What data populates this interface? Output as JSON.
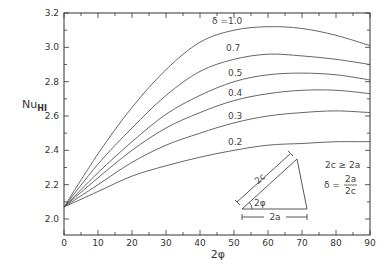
{
  "chart_data": {
    "type": "line",
    "title": "",
    "xlabel": "2φ",
    "ylabel": "Nu_HI",
    "xlim": [
      0,
      90
    ],
    "ylim": [
      2.0,
      3.2
    ],
    "grid": false,
    "x_ticks": [
      0,
      10,
      20,
      30,
      40,
      50,
      60,
      70,
      80,
      90
    ],
    "y_ticks": [
      2.0,
      2.2,
      2.4,
      2.6,
      2.8,
      3.0,
      3.2
    ],
    "x": [
      0,
      10,
      20,
      30,
      40,
      50,
      60,
      70,
      80,
      90
    ],
    "series": [
      {
        "name": "δ = 1.0",
        "label": "δ =1.0",
        "values": [
          2.07,
          2.38,
          2.65,
          2.87,
          3.03,
          3.1,
          3.12,
          3.11,
          3.07,
          3.01
        ]
      },
      {
        "name": "δ = 0.7",
        "label": "0.7",
        "values": [
          2.07,
          2.32,
          2.53,
          2.72,
          2.86,
          2.93,
          2.96,
          2.95,
          2.93,
          2.9
        ]
      },
      {
        "name": "δ = 0.5",
        "label": "0.5",
        "values": [
          2.07,
          2.27,
          2.45,
          2.61,
          2.72,
          2.8,
          2.84,
          2.85,
          2.84,
          2.81
        ]
      },
      {
        "name": "δ = 0.4",
        "label": "0.4",
        "values": [
          2.07,
          2.24,
          2.4,
          2.53,
          2.62,
          2.69,
          2.73,
          2.75,
          2.75,
          2.73
        ]
      },
      {
        "name": "δ = 0.3",
        "label": "0.3",
        "values": [
          2.07,
          2.2,
          2.33,
          2.43,
          2.5,
          2.56,
          2.6,
          2.62,
          2.63,
          2.62
        ]
      },
      {
        "name": "δ = 0.2",
        "label": "0.2",
        "values": [
          2.07,
          2.16,
          2.25,
          2.31,
          2.36,
          2.4,
          2.43,
          2.44,
          2.45,
          2.45
        ]
      }
    ],
    "annotations": {
      "condition": "2c ≥ 2a",
      "delta_def_lhs": "δ =",
      "delta_def_num": "2a",
      "delta_def_den": "2c",
      "inset_hyp_label": "2c",
      "inset_angle_label": "2φ",
      "inset_base_label": "2a"
    }
  },
  "colors": {
    "axis": "#333333",
    "curve": "#555555"
  }
}
